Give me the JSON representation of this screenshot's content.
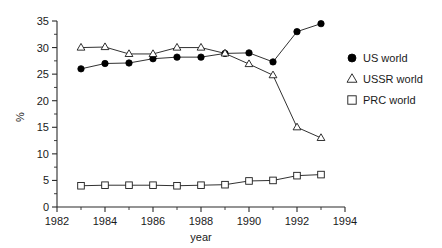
{
  "chart_data": {
    "type": "line",
    "title": "",
    "xlabel": "year",
    "ylabel": "%",
    "xlim": [
      1982,
      1994
    ],
    "ylim": [
      0,
      35
    ],
    "xticks": [
      1982,
      1984,
      1986,
      1988,
      1990,
      1992,
      1994
    ],
    "xtick_labels": [
      "1982",
      "1984",
      "1986",
      "1988",
      "1990",
      "1992",
      "1994"
    ],
    "xminor_step": 1,
    "yticks": [
      0,
      5,
      10,
      15,
      20,
      25,
      30,
      35
    ],
    "ytick_labels": [
      "0",
      "5",
      "10",
      "15",
      "20",
      "25",
      "30",
      "35"
    ],
    "yminor_step": 2.5,
    "grid": false,
    "legend_position": "right",
    "x": [
      1983,
      1984,
      1985,
      1986,
      1987,
      1988,
      1989,
      1990,
      1991,
      1992,
      1993
    ],
    "series": [
      {
        "name": "US world",
        "marker": "filled-circle",
        "color": "#000000",
        "values": [
          26.0,
          27.0,
          27.1,
          27.9,
          28.2,
          28.2,
          28.9,
          29.0,
          27.3,
          33.0,
          34.5
        ]
      },
      {
        "name": "USSR world",
        "marker": "open-triangle",
        "color": "#1a1a1a",
        "values": [
          30.0,
          30.1,
          28.8,
          28.8,
          30.0,
          30.0,
          28.9,
          26.9,
          24.8,
          15.0,
          13.0
        ]
      },
      {
        "name": "PRC world",
        "marker": "open-square",
        "color": "#1a1a1a",
        "values": [
          4.0,
          4.1,
          4.1,
          4.1,
          4.0,
          4.1,
          4.2,
          4.9,
          5.0,
          5.9,
          6.1
        ]
      }
    ]
  },
  "legend": {
    "entries": [
      {
        "label": "US world",
        "marker": "filled-circle"
      },
      {
        "label": "USSR world",
        "marker": "open-triangle"
      },
      {
        "label": "PRC world",
        "marker": "open-square"
      }
    ]
  },
  "axes": {
    "x_axis_title": "year",
    "y_axis_title": "%"
  }
}
